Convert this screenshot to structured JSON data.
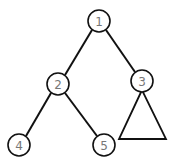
{
  "diagram": {
    "type": "binary-tree",
    "nodes": [
      {
        "id": "1",
        "label": "1",
        "cx": 99,
        "cy": 21
      },
      {
        "id": "2",
        "label": "2",
        "cx": 58,
        "cy": 84
      },
      {
        "id": "3",
        "label": "3",
        "cx": 142,
        "cy": 81
      },
      {
        "id": "4",
        "label": "4",
        "cx": 19,
        "cy": 145
      },
      {
        "id": "5",
        "label": "5",
        "cx": 104,
        "cy": 145
      }
    ],
    "edges": [
      {
        "from": "1",
        "to": "2"
      },
      {
        "from": "1",
        "to": "3"
      },
      {
        "from": "2",
        "to": "4"
      },
      {
        "from": "2",
        "to": "5"
      }
    ],
    "subtrees": [
      {
        "under": "3",
        "shape": "triangle"
      }
    ],
    "colors": {
      "stroke": "#111111",
      "label": "#777777",
      "background": "#ffffff"
    }
  }
}
